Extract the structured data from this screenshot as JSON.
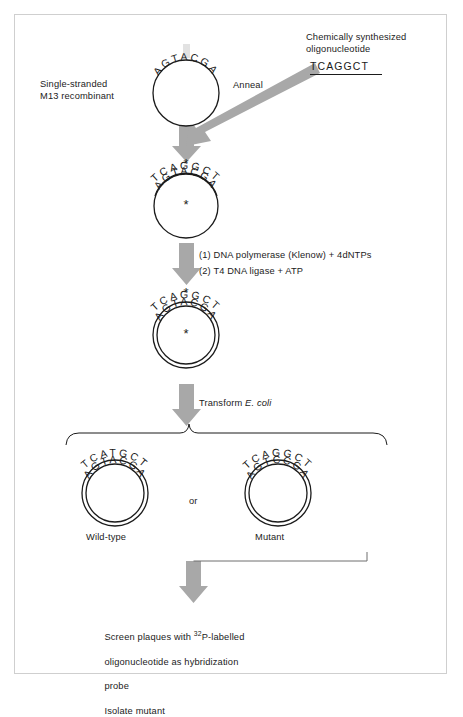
{
  "figure": {
    "background": "#ffffff",
    "frame_color": "#cfcfcf",
    "arrow_color": "#a8a8a8",
    "ink_color": "#1b1b1b"
  },
  "labels": {
    "single_stranded_line1": "Single-stranded",
    "single_stranded_line2": "M13 recombinant",
    "chem_synth_line1": "Chemically synthesized",
    "chem_synth_line2": "oligonucleotide",
    "oligo_sequence": "TCAGGCT",
    "anneal": "Anneal",
    "step1": "(1) DNA polymerase (Klenow) + 4dNTPs",
    "step2": "(2) T4 DNA ligase + ATP",
    "transform_pre": "Transform ",
    "transform_italic": "E. coli",
    "or": "or",
    "wild_type": "Wild-type",
    "mutant": "Mutant",
    "screen_line1_pre": "Screen plaques with ",
    "screen_sup": "32",
    "screen_line1_post": "P-labelled",
    "screen_line2": "oligonucleotide as hybridization",
    "screen_line3": "probe",
    "screen_line4": "Isolate mutant"
  },
  "circles": {
    "ssdna": {
      "name": "single-stranded-m13-circle",
      "inner_sequence": "AGTACGA",
      "outer_sequence": "",
      "double_stranded": false,
      "asterisk_inner": false,
      "asterisk_outer": false
    },
    "annealed": {
      "name": "annealed-heteroduplex-circle",
      "inner_sequence": "AGTACGA",
      "outer_sequence": "TCAGGCT",
      "double_stranded": false,
      "asterisk_inner": true,
      "asterisk_outer": true
    },
    "closed": {
      "name": "closed-circular-heteroduplex",
      "inner_sequence": "AGTACGA",
      "outer_sequence": "TCAGGCT",
      "double_stranded": true,
      "asterisk_inner": true,
      "asterisk_outer": true
    },
    "wildtype": {
      "name": "wild-type-progeny-circle",
      "inner_sequence": "AGTACGA",
      "outer_sequence": "TCATGCT",
      "double_stranded": true,
      "asterisk_inner": false,
      "asterisk_outer": false
    },
    "mutant": {
      "name": "mutant-progeny-circle",
      "inner_sequence": "AGTCCGA",
      "outer_sequence": "TCAGGCT",
      "double_stranded": true,
      "asterisk_inner": false,
      "asterisk_outer": false
    }
  }
}
